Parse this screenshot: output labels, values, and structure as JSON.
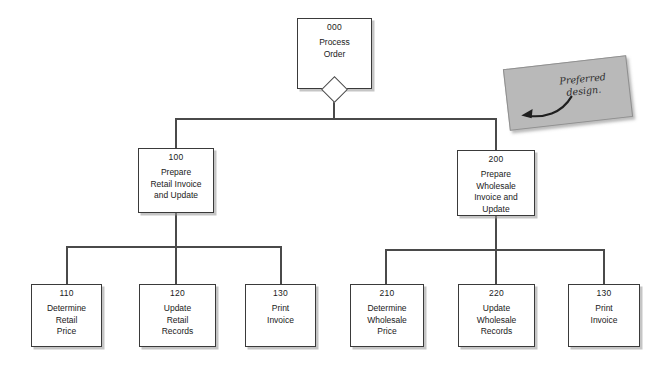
{
  "diagram": {
    "type": "structure-chart",
    "colors": {
      "box_border": "#3a3a3a",
      "line": "#4a4a4a",
      "box_fill": "#ffffff",
      "sticky_fill": "#b9b9b9",
      "background": "#ffffff"
    },
    "nodes": [
      {
        "id": "000",
        "title": "Process\nOrder",
        "level": 0
      },
      {
        "id": "100",
        "title": "Prepare\nRetail Invoice\nand Update",
        "level": 1
      },
      {
        "id": "200",
        "title": "Prepare\nWholesale\nInvoice and\nUpdate",
        "level": 1
      },
      {
        "id": "110",
        "title": "Determine\nRetail\nPrice",
        "level": 2
      },
      {
        "id": "120",
        "title": "Update\nRetail\nRecords",
        "level": 2
      },
      {
        "id": "130",
        "title": "Print\nInvoice",
        "level": 2
      },
      {
        "id": "210",
        "title": "Determine\nWholesale\nPrice",
        "level": 2
      },
      {
        "id": "220",
        "title": "Update\nWholesale\nRecords",
        "level": 2
      },
      {
        "id": "130r",
        "title": "Print\nInvoice",
        "level": 2
      }
    ],
    "node_ids": {
      "n000": "000",
      "n100": "100",
      "n200": "200",
      "n110": "110",
      "n120": "120",
      "n130": "130",
      "n210": "210",
      "n220": "220",
      "n130r": "130"
    },
    "node_titles": {
      "n000": "Process\nOrder",
      "n100": "Prepare\nRetail Invoice\nand Update",
      "n200": "Prepare\nWholesale\nInvoice and\nUpdate",
      "n110": "Determine\nRetail\nPrice",
      "n120": "Update\nRetail\nRecords",
      "n130": "Print\nInvoice",
      "n210": "Determine\nWholesale\nPrice",
      "n220": "Update\nWholesale\nRecords",
      "n130r": "Print\nInvoice"
    }
  },
  "annotation": {
    "sticky_note_text": "Preferred design.",
    "arrow_icon": "curved-arrow-left-icon"
  }
}
